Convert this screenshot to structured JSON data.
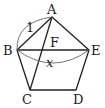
{
  "diagram": {
    "colors": {
      "stroke": "#222222",
      "arc": "#555555",
      "background": "#ffffff"
    },
    "vertices": {
      "A": {
        "label": "A",
        "x": 52,
        "y": 17
      },
      "B": {
        "label": "B",
        "x": 17,
        "y": 50
      },
      "C": {
        "label": "C",
        "x": 30,
        "y": 90
      },
      "D": {
        "label": "D",
        "x": 76,
        "y": 90
      },
      "E": {
        "label": "E",
        "x": 89,
        "y": 50
      }
    },
    "intersection": {
      "label": "F",
      "x": 45,
      "y": 50
    },
    "segments": [
      "AB",
      "BC",
      "CD",
      "DE",
      "EA",
      "BE",
      "AC"
    ],
    "measures": {
      "AB": {
        "label": "1"
      },
      "BE": {
        "label": "x"
      }
    }
  }
}
